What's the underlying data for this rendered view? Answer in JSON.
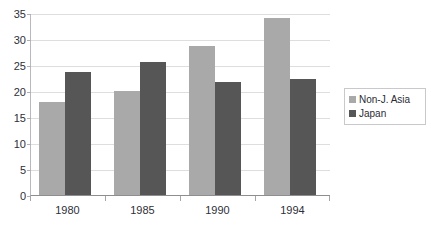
{
  "chart_data": {
    "type": "bar",
    "title": "",
    "xlabel": "",
    "ylabel": "",
    "categories": [
      "1980",
      "1985",
      "1990",
      "1994"
    ],
    "series": [
      {
        "name": "Non-J. Asia",
        "color": "#a9a9a9",
        "values": [
          17.8,
          20.0,
          28.7,
          34.0
        ]
      },
      {
        "name": "Japan",
        "color": "#565656",
        "values": [
          23.6,
          25.6,
          21.7,
          22.3
        ]
      }
    ],
    "ylim": [
      0,
      35
    ],
    "yticks": [
      0,
      5,
      10,
      15,
      20,
      25,
      30,
      35
    ],
    "ytick_labels": [
      "0",
      "5",
      "10",
      "15",
      "20",
      "25",
      "30",
      "35"
    ],
    "grid": true,
    "legend_position": "right"
  },
  "legend": {
    "entries": [
      {
        "label": "Non-J. Asia",
        "swatch_color": "#a9a9a9"
      },
      {
        "label": "Japan",
        "swatch_color": "#565656"
      }
    ]
  },
  "axes": {
    "y_axis_name": "value-axis",
    "x_axis_name": "category-axis"
  }
}
